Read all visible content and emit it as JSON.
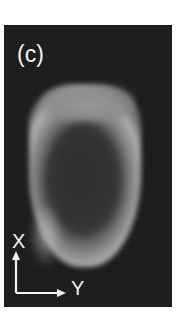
{
  "figure": {
    "panel_label": "(c)",
    "axes": {
      "vertical_label": "X",
      "horizontal_label": "Y"
    },
    "colors": {
      "background": "#1c1c1c",
      "ring": "#b0b0b0",
      "core": "#353535",
      "text": "#f2f2f2"
    }
  }
}
